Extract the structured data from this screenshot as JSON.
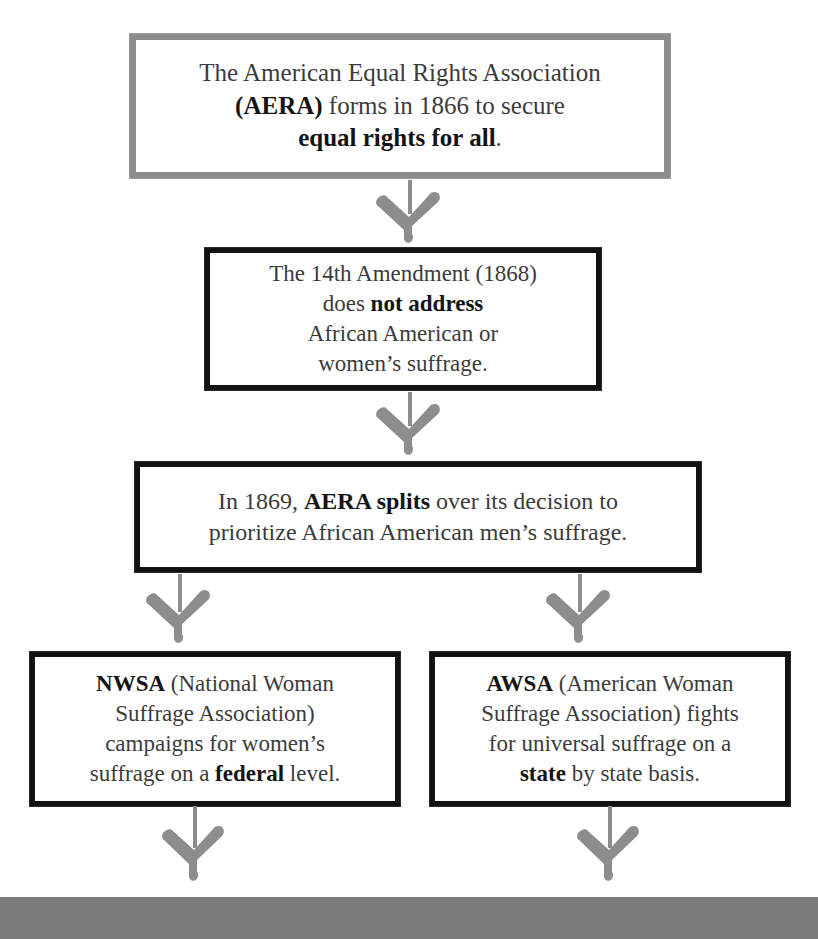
{
  "diagram": {
    "colors": {
      "ink_black": "#121212",
      "ink_gray": "#8d8d8d",
      "arrow_gray": "#8d8d8d",
      "body_text": "#3b3b3b",
      "bold_text": "#141414",
      "bottom_bar": "#7b7b7b",
      "background": "#ffffff"
    },
    "nodes": {
      "aera": {
        "id": "aera",
        "border_style": "gray",
        "lines": [
          {
            "segments": [
              {
                "text": "The American Equal Rights Association",
                "bold": false
              }
            ]
          },
          {
            "segments": [
              {
                "text": "(AERA)",
                "bold": true
              },
              {
                "text": " forms in 1866 to secure",
                "bold": false
              }
            ]
          },
          {
            "segments": [
              {
                "text": "equal rights for all",
                "bold": true
              },
              {
                "text": ".",
                "bold": false
              }
            ]
          }
        ],
        "plain_text": "The American Equal Rights Association (AERA) forms in 1866 to secure equal rights for all."
      },
      "amendment14": {
        "id": "amendment14",
        "border_style": "black",
        "lines": [
          {
            "segments": [
              {
                "text": "The 14th Amendment (1868)",
                "bold": false
              }
            ]
          },
          {
            "segments": [
              {
                "text": "does ",
                "bold": false
              },
              {
                "text": "not address",
                "bold": true
              }
            ]
          },
          {
            "segments": [
              {
                "text": "African American or",
                "bold": false
              }
            ]
          },
          {
            "segments": [
              {
                "text": "women’s suffrage.",
                "bold": false
              }
            ]
          }
        ],
        "plain_text": "The 14th Amendment (1868) does not address African American or women’s suffrage."
      },
      "split": {
        "id": "split",
        "border_style": "black",
        "lines": [
          {
            "segments": [
              {
                "text": "In 1869, ",
                "bold": false
              },
              {
                "text": "AERA splits",
                "bold": true
              },
              {
                "text": " over its decision to",
                "bold": false
              }
            ]
          },
          {
            "segments": [
              {
                "text": "prioritize African American men’s suffrage.",
                "bold": false
              }
            ]
          }
        ],
        "plain_text": "In 1869, AERA splits over its decision to prioritize African American men’s suffrage."
      },
      "nwsa": {
        "id": "nwsa",
        "border_style": "black",
        "lines": [
          {
            "segments": [
              {
                "text": "NWSA",
                "bold": true
              },
              {
                "text": " (National Woman",
                "bold": false
              }
            ]
          },
          {
            "segments": [
              {
                "text": "Suffrage Association)",
                "bold": false
              }
            ]
          },
          {
            "segments": [
              {
                "text": "campaigns for women’s",
                "bold": false
              }
            ]
          },
          {
            "segments": [
              {
                "text": "suffrage on a ",
                "bold": false
              },
              {
                "text": "federal",
                "bold": true
              },
              {
                "text": " level.",
                "bold": false
              }
            ]
          }
        ],
        "plain_text": "NWSA (National Woman Suffrage Association) campaigns for women’s suffrage on a federal level."
      },
      "awsa": {
        "id": "awsa",
        "border_style": "black",
        "lines": [
          {
            "segments": [
              {
                "text": "AWSA",
                "bold": true
              },
              {
                "text": " (American Woman",
                "bold": false
              }
            ]
          },
          {
            "segments": [
              {
                "text": "Suffrage Association) fights",
                "bold": false
              }
            ]
          },
          {
            "segments": [
              {
                "text": "for universal suffrage on a",
                "bold": false
              }
            ]
          },
          {
            "segments": [
              {
                "text": "state",
                "bold": true
              },
              {
                "text": " by state basis.",
                "bold": false
              }
            ]
          }
        ],
        "plain_text": "AWSA (American Woman Suffrage Association) fights for universal suffrage on a state by state basis."
      }
    },
    "connectors": [
      {
        "id": "arrow-aera-to-14th",
        "from": "aera",
        "to": "amendment14"
      },
      {
        "id": "arrow-14th-to-split",
        "from": "amendment14",
        "to": "split"
      },
      {
        "id": "arrow-split-to-nwsa",
        "from": "split",
        "to": "nwsa"
      },
      {
        "id": "arrow-split-to-awsa",
        "from": "split",
        "to": "awsa"
      },
      {
        "id": "arrow-nwsa-to-bar",
        "from": "nwsa",
        "to": "bottom-bar"
      },
      {
        "id": "arrow-awsa-to-bar",
        "from": "awsa",
        "to": "bottom-bar"
      }
    ],
    "bottom_bar": {
      "label": ""
    }
  }
}
